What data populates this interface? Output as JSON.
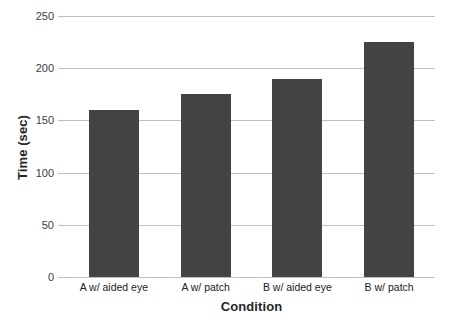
{
  "chart_data": {
    "type": "bar",
    "title": "",
    "categories": [
      "A w/ aided eye",
      "A w/ patch",
      "B w/ aided eye",
      "B w/ patch"
    ],
    "values": [
      160,
      175,
      190,
      225
    ],
    "xlabel": "Condition",
    "ylabel": "Time (sec)",
    "ylim": [
      0,
      250
    ],
    "yticks": [
      0,
      50,
      100,
      150,
      200,
      250
    ],
    "ytick_labels": [
      "0",
      "50",
      "100",
      "150",
      "200",
      "250"
    ],
    "grid": "horizontal",
    "legend": "none",
    "bar_color": "#434343",
    "gridline_color": "#bfbfbf",
    "background_color": "#ffffff"
  }
}
